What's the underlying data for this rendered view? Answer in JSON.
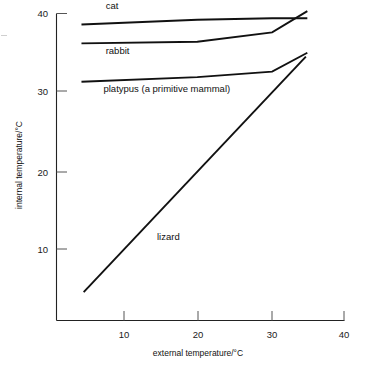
{
  "chart_data": {
    "type": "line",
    "title": "",
    "xlabel": "external temperature/°C",
    "ylabel": "internal temperature/°C",
    "xlim": [
      0,
      42
    ],
    "ylim": [
      0,
      41.5
    ],
    "xticks": [
      10,
      20,
      30,
      40
    ],
    "yticks": [
      10,
      20,
      30,
      40
    ],
    "xtick_labels": [
      "10",
      "20",
      "30",
      "40"
    ],
    "ytick_labels": [
      "10",
      "20",
      "30",
      "40"
    ],
    "grid": false,
    "legend": "inline-labels",
    "series": [
      {
        "name": "cat",
        "label": "cat",
        "x": [
          4.2,
          20.0,
          30.2,
          35.0
        ],
        "y": [
          38.6,
          39.2,
          39.4,
          39.4
        ]
      },
      {
        "name": "rabbit",
        "label": "rabbit",
        "x": [
          4.2,
          20.0,
          30.2,
          35.0
        ],
        "y": [
          36.2,
          36.4,
          37.6,
          40.3
        ]
      },
      {
        "name": "platypus",
        "label": "platypus (a primitive mammal)",
        "x": [
          4.2,
          20.0,
          30.2,
          35.0
        ],
        "y": [
          31.3,
          31.9,
          32.6,
          35.0
        ]
      },
      {
        "name": "lizard",
        "label": "lizard",
        "x": [
          4.5,
          34.8
        ],
        "y": [
          4.5,
          34.5
        ]
      }
    ],
    "annotations": [
      {
        "name": "cat-label",
        "text": "cat",
        "x": 7.5,
        "y": 40.6
      },
      {
        "name": "rabbit-label",
        "text": "rabbit",
        "x": 7.5,
        "y": 34.8
      },
      {
        "name": "platypus-label",
        "text": "platypus (a primitive mammal)",
        "x": 7.2,
        "y": 30.0
      },
      {
        "name": "lizard-label",
        "text": "lizard",
        "x": 14.5,
        "y": 11.2
      }
    ]
  },
  "colors": {
    "line": "#111111",
    "axis": "#222222",
    "tick": "#555555",
    "text": "#111111",
    "background": "#ffffff"
  }
}
